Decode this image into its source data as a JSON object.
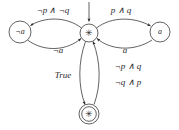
{
  "figure": {
    "type": "finite-state-automaton-diagram",
    "background_color": "#ffffff",
    "stroke_color": "#3a3a3a",
    "text_color": "#2a2a2a"
  },
  "states": [
    {
      "id": "left",
      "label": "¬a",
      "shape": "circle",
      "accepting": false,
      "cx": 20,
      "cy": 32,
      "r": 11
    },
    {
      "id": "center",
      "label": "✳",
      "shape": "circle",
      "accepting": false,
      "initial": true,
      "cx": 89,
      "cy": 33,
      "r": 9
    },
    {
      "id": "right",
      "label": "a",
      "shape": "circle",
      "accepting": false,
      "cx": 160,
      "cy": 32,
      "r": 10
    },
    {
      "id": "bottom",
      "label": "✳",
      "shape": "double-circle",
      "accepting": true,
      "cx": 89,
      "cy": 114,
      "r": 10
    }
  ],
  "transitions": [
    {
      "id": "center-to-left",
      "from": "center",
      "to": "left",
      "label": "¬p ∧ ¬q",
      "label_x": 53,
      "label_y": 11
    },
    {
      "id": "left-to-center",
      "from": "left",
      "to": "center",
      "label": "¬a",
      "label_x": 58,
      "label_y": 51
    },
    {
      "id": "center-to-right",
      "from": "center",
      "to": "right",
      "label": "p ∧ q",
      "label_x": 121,
      "label_y": 11
    },
    {
      "id": "right-to-center",
      "from": "right",
      "to": "center",
      "label": "a",
      "label_x": 125,
      "label_y": 51
    },
    {
      "id": "center-to-bottom",
      "from": "center",
      "to": "bottom",
      "label": "True",
      "label_x": 63,
      "label_y": 76
    },
    {
      "id": "bottom-to-center",
      "from": "bottom",
      "to": "center",
      "label_line1": "¬p ∧ q",
      "label_line2": "¬q ∧ p",
      "label_x": 128,
      "label_y1": 67,
      "label_y2": 83
    }
  ],
  "initial_marker": {
    "id": "initial-arrow",
    "target": "center",
    "direction": "from-top"
  }
}
